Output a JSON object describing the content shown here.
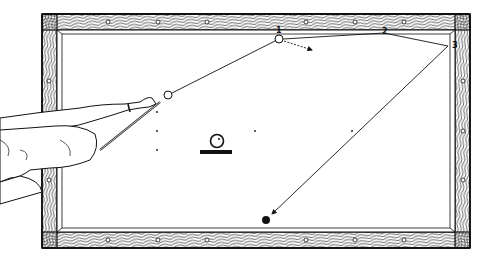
{
  "figure": {
    "rail_labels": [
      "1",
      "2",
      "3"
    ],
    "colors": {
      "ink": "#111111",
      "cloth": "#ffffff",
      "rail_fill": "#f4f4f4"
    }
  }
}
